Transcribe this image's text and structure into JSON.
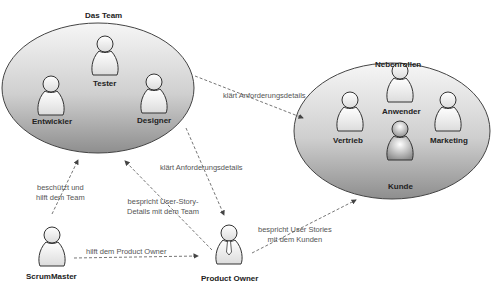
{
  "groups": {
    "team": {
      "title": "Das Team",
      "members": [
        "Tester",
        "Entwickler",
        "Designer"
      ]
    },
    "side": {
      "title": "Nebenrollen",
      "members": [
        "Anwender",
        "Vertrieb",
        "Marketing",
        "Kunde"
      ]
    }
  },
  "roles": {
    "scrummaster": "ScrumMaster",
    "product_owner": "Product Owner"
  },
  "edges": {
    "team_to_side": "klärt Anforderungsdetails",
    "team_to_po": "klärt Anforderungsdetails",
    "sm_to_team": [
      "beschützt und",
      "hilft dem Team"
    ],
    "po_to_team": [
      "bespricht User-Story-",
      "Details mit dem Team"
    ],
    "sm_to_po": "hilft dem Product Owner",
    "po_to_side": [
      "bespricht User Stories",
      "mit dem Kunden"
    ]
  },
  "colors": {
    "ellipse_light": "#f4f4f4",
    "ellipse_dark": "#9a9a9a",
    "stroke": "#333333",
    "dash": "#666666"
  }
}
